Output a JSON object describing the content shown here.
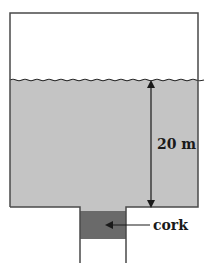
{
  "diagram": {
    "type": "tank-with-corked-drain",
    "colors": {
      "water": "#c4c4c4",
      "cork": "#6a6a6a",
      "walls": "#4a4a4a",
      "background": "#ffffff",
      "text": "#1a1a1a"
    },
    "tank": {
      "left": 10,
      "top": 13,
      "right": 198,
      "bottom": 207
    },
    "water_surface_y": 80,
    "neck": {
      "left": 80,
      "right": 126,
      "bottom": 263
    },
    "cork": {
      "top": 211,
      "bottom": 239
    },
    "depth_arrow": {
      "x": 151,
      "y_top": 82,
      "y_bottom": 206
    },
    "labels": {
      "depth": "20 m",
      "cork": "cork"
    }
  }
}
